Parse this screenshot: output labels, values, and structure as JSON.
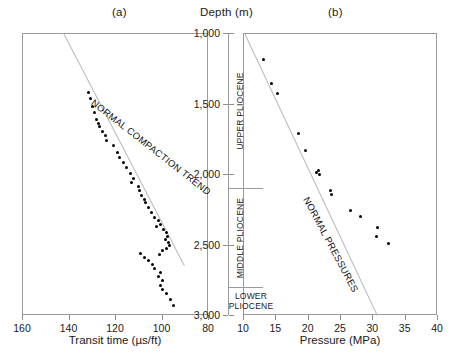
{
  "figure": {
    "panel_a_letter": "(a)",
    "panel_b_letter": "(b)",
    "depth_axis_title": "Depth (m)"
  },
  "chart_data": [
    {
      "type": "scatter",
      "panel": "(a)",
      "title": "(a)",
      "xlabel": "Transit time (µs/ft)",
      "ylabel": "Depth (m)",
      "xlim": [
        160,
        80
      ],
      "ylim": [
        3000,
        1000
      ],
      "x_reversed": true,
      "y_reversed": true,
      "xticks": [
        160,
        140,
        120,
        100,
        80
      ],
      "xticklabels": [
        "160",
        "140",
        "120",
        "100",
        "80"
      ],
      "yticks": [
        1000,
        1500,
        2000,
        2500,
        3000
      ],
      "yticklabels": [
        "1,000",
        "1,500",
        "2,000",
        "2,500",
        "3,000"
      ],
      "grid": false,
      "legend": "none",
      "annotations": [
        {
          "text": "NORMAL COMPACTION TREND",
          "rotation_deg": 38,
          "x_data": 128,
          "y_data": 1450
        }
      ],
      "reference_line": {
        "name": "normal-compaction-trend-line",
        "color": "#b9b9b9",
        "points": [
          {
            "x": 142.0,
            "y": 1000
          },
          {
            "x": 90.0,
            "y": 2650
          }
        ]
      },
      "series": [
        {
          "name": "transit-time",
          "marker": "filled-circle",
          "color": "#000000",
          "points": [
            {
              "x": 131.5,
              "y": 1420
            },
            {
              "x": 130.5,
              "y": 1465
            },
            {
              "x": 129.5,
              "y": 1520
            },
            {
              "x": 129.0,
              "y": 1560
            },
            {
              "x": 128.0,
              "y": 1610
            },
            {
              "x": 127.0,
              "y": 1640
            },
            {
              "x": 126.5,
              "y": 1665
            },
            {
              "x": 125.5,
              "y": 1700
            },
            {
              "x": 124.0,
              "y": 1730
            },
            {
              "x": 123.5,
              "y": 1760
            },
            {
              "x": 120.5,
              "y": 1800
            },
            {
              "x": 119.0,
              "y": 1845
            },
            {
              "x": 118.0,
              "y": 1880
            },
            {
              "x": 116.5,
              "y": 1915
            },
            {
              "x": 115.0,
              "y": 1955
            },
            {
              "x": 113.5,
              "y": 1995
            },
            {
              "x": 112.0,
              "y": 2030
            },
            {
              "x": 113.0,
              "y": 2060
            },
            {
              "x": 110.0,
              "y": 2090
            },
            {
              "x": 109.5,
              "y": 2120
            },
            {
              "x": 108.5,
              "y": 2150
            },
            {
              "x": 107.5,
              "y": 2180
            },
            {
              "x": 107.0,
              "y": 2205
            },
            {
              "x": 105.5,
              "y": 2240
            },
            {
              "x": 104.5,
              "y": 2270
            },
            {
              "x": 103.0,
              "y": 2305
            },
            {
              "x": 101.5,
              "y": 2330
            },
            {
              "x": 100.5,
              "y": 2355
            },
            {
              "x": 102.0,
              "y": 2375
            },
            {
              "x": 99.0,
              "y": 2395
            },
            {
              "x": 98.0,
              "y": 2415
            },
            {
              "x": 97.5,
              "y": 2440
            },
            {
              "x": 98.5,
              "y": 2465
            },
            {
              "x": 97.0,
              "y": 2485
            },
            {
              "x": 96.5,
              "y": 2505
            },
            {
              "x": 98.0,
              "y": 2525
            },
            {
              "x": 99.5,
              "y": 2545
            },
            {
              "x": 101.0,
              "y": 2570
            },
            {
              "x": 109.0,
              "y": 2560
            },
            {
              "x": 107.5,
              "y": 2590
            },
            {
              "x": 105.5,
              "y": 2615
            },
            {
              "x": 104.0,
              "y": 2645
            },
            {
              "x": 103.0,
              "y": 2670
            },
            {
              "x": 100.5,
              "y": 2700
            },
            {
              "x": 101.5,
              "y": 2725
            },
            {
              "x": 99.5,
              "y": 2755
            },
            {
              "x": 100.5,
              "y": 2790
            },
            {
              "x": 99.5,
              "y": 2820
            },
            {
              "x": 98.0,
              "y": 2850
            },
            {
              "x": 96.0,
              "y": 2890
            },
            {
              "x": 95.0,
              "y": 2930
            }
          ]
        }
      ]
    },
    {
      "type": "scatter",
      "panel": "(b)",
      "title": "(b)",
      "xlabel": "Pressure (MPa)",
      "ylabel": "Depth (m)",
      "xlim": [
        10,
        40
      ],
      "ylim": [
        3000,
        1000
      ],
      "x_reversed": false,
      "y_reversed": true,
      "xticks": [
        10,
        15,
        20,
        25,
        30,
        35,
        40
      ],
      "xticklabels": [
        "10",
        "15",
        "20",
        "25",
        "30",
        "35",
        "40"
      ],
      "yticks": [
        1000,
        1500,
        2000,
        2500,
        3000
      ],
      "yticklabels": [
        "1,000",
        "1,500",
        "2,000",
        "2,500",
        "3,000"
      ],
      "grid": false,
      "legend": "none",
      "annotations": [
        {
          "text": "NORMAL PRESSURES",
          "rotation_deg": 62,
          "x_data": 20.5,
          "y_data": 2150
        }
      ],
      "reference_line": {
        "name": "normal-pressures-line",
        "color": "#b9b9b9",
        "points": [
          {
            "x": 10.3,
            "y": 1000
          },
          {
            "x": 30.8,
            "y": 3000
          }
        ]
      },
      "series": [
        {
          "name": "pore-pressure",
          "marker": "filled-circle",
          "color": "#000000",
          "points": [
            {
              "x": 13.1,
              "y": 1190
            },
            {
              "x": 14.4,
              "y": 1360
            },
            {
              "x": 15.4,
              "y": 1430
            },
            {
              "x": 18.6,
              "y": 1710
            },
            {
              "x": 19.6,
              "y": 1835
            },
            {
              "x": 21.4,
              "y": 1990
            },
            {
              "x": 21.7,
              "y": 1975
            },
            {
              "x": 21.8,
              "y": 2000
            },
            {
              "x": 23.6,
              "y": 2120
            },
            {
              "x": 23.7,
              "y": 2145
            },
            {
              "x": 26.6,
              "y": 2260
            },
            {
              "x": 28.1,
              "y": 2300
            },
            {
              "x": 30.8,
              "y": 2380
            },
            {
              "x": 30.6,
              "y": 2440
            },
            {
              "x": 32.5,
              "y": 2490
            }
          ]
        }
      ]
    }
  ],
  "stratigraphy": {
    "units": [
      {
        "label": "UPPER PLIOCENE",
        "top_depth": 1000,
        "base_depth": 2100,
        "orientation": "vertical"
      },
      {
        "label": "MIDDLE PLIOCENE",
        "top_depth": 2100,
        "base_depth": 2800,
        "orientation": "vertical"
      },
      {
        "label": "LOWER\nPLIOCENE",
        "line1": "LOWER",
        "line2": "PLIOCENE",
        "top_depth": 2800,
        "base_depth": 3000,
        "orientation": "horizontal"
      }
    ]
  }
}
